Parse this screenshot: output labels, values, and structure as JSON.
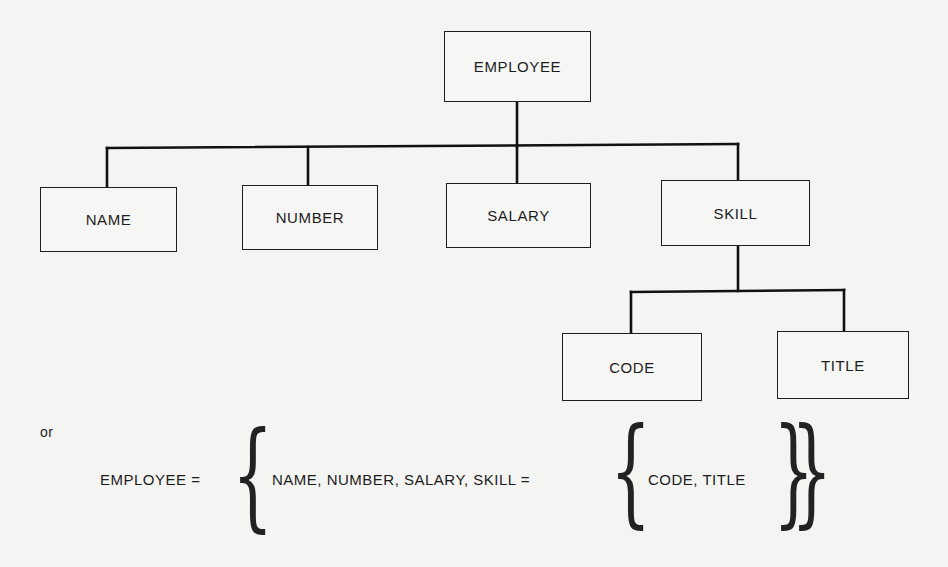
{
  "diagram": {
    "type": "hierarchy-tree",
    "root": {
      "label": "EMPLOYEE"
    },
    "children": [
      {
        "label": "NAME"
      },
      {
        "label": "NUMBER"
      },
      {
        "label": "SALARY"
      },
      {
        "label": "SKILL",
        "children": [
          {
            "label": "CODE"
          },
          {
            "label": "TITLE"
          }
        ]
      }
    ],
    "connector_color": "#111111",
    "box_border_color": "#1e1e1e"
  },
  "alternative": {
    "or_label": "or",
    "lhs": "EMPLOYEE =",
    "inner_lhs": "NAME, NUMBER, SALARY, SKILL =",
    "inner_set": "CODE, TITLE",
    "open_brace": "{",
    "close_brace": "}"
  }
}
